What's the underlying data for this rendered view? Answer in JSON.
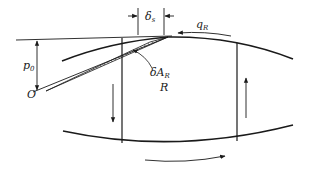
{
  "diagram": {
    "labels": {
      "delta_s": {
        "main": "δ",
        "sub": "s"
      },
      "q_R": {
        "main": "q",
        "sub": "R"
      },
      "delta_A_R": {
        "main": "δA",
        "sub": "R"
      },
      "R": {
        "main": "R"
      },
      "p0": {
        "main": "p",
        "sub": "0"
      },
      "O": {
        "main": "O"
      }
    },
    "colors": {
      "stroke": "#1a1a1a",
      "background": "#ffffff"
    }
  }
}
